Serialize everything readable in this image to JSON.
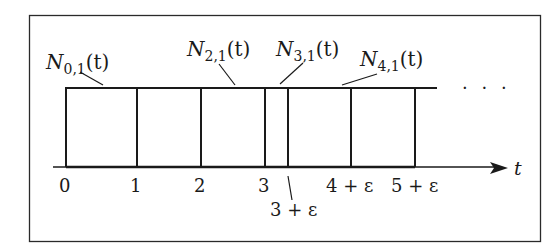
{
  "diagram": {
    "axis": {
      "label": "t"
    },
    "tick_labels": [
      "0",
      "1",
      "2",
      "3",
      "3 + ε",
      "4 + ε",
      "5 + ε"
    ],
    "functions": [
      {
        "name": "N",
        "sub": "0,1",
        "arg": "(t)"
      },
      {
        "name": "N",
        "sub": "2,1",
        "arg": "(t)"
      },
      {
        "name": "N",
        "sub": "3,1",
        "arg": "(t)"
      },
      {
        "name": "N",
        "sub": "4,1",
        "arg": "(t)"
      }
    ],
    "continuation": "· · ·"
  }
}
